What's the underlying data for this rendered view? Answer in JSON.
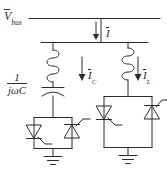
{
  "diagram": {
    "stroke_color": "#2b2b2b",
    "background_color": "#ffffff",
    "labels": {
      "bus_voltage": {
        "symbol": "V",
        "subscript": "bus",
        "overbar": true
      },
      "total_current": {
        "symbol": "I",
        "subscript": "",
        "overbar": true
      },
      "capacitor_current": {
        "symbol": "I",
        "subscript": "C",
        "overbar": true
      },
      "reactor_current": {
        "symbol": "I",
        "subscript": "L",
        "overbar": true
      },
      "capacitor_impedance": {
        "numerator": "1",
        "denominator": "jωC"
      }
    },
    "branches": [
      {
        "name": "thyristor-switched-capacitor",
        "components": [
          "inductor",
          "capacitor",
          "thyristor-pair",
          "ground"
        ],
        "current_label": "I_C"
      },
      {
        "name": "thyristor-controlled-reactor",
        "components": [
          "inductor",
          "thyristor-pair",
          "ground"
        ],
        "current_label": "I_L"
      }
    ]
  }
}
